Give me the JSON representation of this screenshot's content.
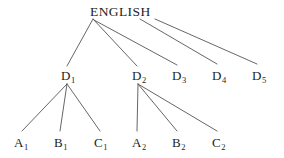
{
  "diagram": {
    "title": "ENGLISH",
    "type": "tree",
    "background_color": "#ffffff",
    "line_color": "#555555",
    "text_color": "#1d1d1d",
    "root": {
      "id": "root",
      "label": "ENGLISH",
      "base": "ENGLISH",
      "subscript": "",
      "x": 90,
      "y": 5,
      "anchor_x": 93,
      "anchor_y": 19
    },
    "level2": [
      {
        "id": "d1",
        "base": "D",
        "subscript": "1",
        "x": 61,
        "y": 69,
        "anchor_x": 67,
        "anchor_y": 67,
        "branch_apex_x": 67,
        "branch_apex_y": 84
      },
      {
        "id": "d2",
        "base": "D",
        "subscript": "2",
        "x": 132,
        "y": 69,
        "anchor_x": 138,
        "anchor_y": 67,
        "branch_apex_x": 138,
        "branch_apex_y": 84
      },
      {
        "id": "d3",
        "base": "D",
        "subscript": "3",
        "x": 172,
        "y": 69,
        "anchor_x": 178,
        "anchor_y": 67,
        "branch_apex_x": null,
        "branch_apex_y": null
      },
      {
        "id": "d4",
        "base": "D",
        "subscript": "4",
        "x": 212,
        "y": 69,
        "anchor_x": 218,
        "anchor_y": 67,
        "branch_apex_x": null,
        "branch_apex_y": null
      },
      {
        "id": "d5",
        "base": "D",
        "subscript": "5",
        "x": 252,
        "y": 69,
        "anchor_x": 258,
        "anchor_y": 67,
        "branch_apex_x": null,
        "branch_apex_y": null
      }
    ],
    "level3": [
      {
        "id": "a1",
        "base": "A",
        "subscript": "1",
        "x": 14,
        "y": 136,
        "anchor_x": 21,
        "anchor_y": 133,
        "parent": "d1"
      },
      {
        "id": "b1",
        "base": "B",
        "subscript": "1",
        "x": 54,
        "y": 136,
        "anchor_x": 60,
        "anchor_y": 133,
        "parent": "d1"
      },
      {
        "id": "c1",
        "base": "C",
        "subscript": "1",
        "x": 94,
        "y": 136,
        "anchor_x": 100,
        "anchor_y": 133,
        "parent": "d1"
      },
      {
        "id": "a2",
        "base": "A",
        "subscript": "2",
        "x": 132,
        "y": 136,
        "anchor_x": 138,
        "anchor_y": 133,
        "parent": "d2"
      },
      {
        "id": "b2",
        "base": "B",
        "subscript": "2",
        "x": 172,
        "y": 136,
        "anchor_x": 178,
        "anchor_y": 133,
        "parent": "d2"
      },
      {
        "id": "c2",
        "base": "C",
        "subscript": "2",
        "x": 212,
        "y": 136,
        "anchor_x": 218,
        "anchor_y": 133,
        "parent": "d2"
      }
    ],
    "edges": [
      {
        "id": "edge-root-d1",
        "from": "root",
        "to": "d1",
        "x1": 93,
        "y1": 19,
        "x2": 67,
        "y2": 66
      },
      {
        "id": "edge-root-d2",
        "from": "root",
        "to": "d2",
        "x1": 93,
        "y1": 19,
        "x2": 137,
        "y2": 66
      },
      {
        "id": "edge-root-d3",
        "from": "root",
        "to": "d3",
        "x1": 94,
        "y1": 20,
        "x2": 177,
        "y2": 65
      },
      {
        "id": "edge-root-d4",
        "from": "root",
        "to": "d4",
        "x1": 140,
        "y1": 19,
        "x2": 217,
        "y2": 64
      },
      {
        "id": "edge-root-d5",
        "from": "root",
        "to": "d5",
        "x1": 155,
        "y1": 19,
        "x2": 257,
        "y2": 64
      },
      {
        "id": "edge-d1-a1",
        "from": "d1",
        "to": "a1",
        "x1": 67,
        "y1": 84,
        "x2": 22,
        "y2": 131
      },
      {
        "id": "edge-d1-b1",
        "from": "d1",
        "to": "b1",
        "x1": 67,
        "y1": 84,
        "x2": 60,
        "y2": 131
      },
      {
        "id": "edge-d1-c1",
        "from": "d1",
        "to": "c1",
        "x1": 67,
        "y1": 84,
        "x2": 100,
        "y2": 131
      },
      {
        "id": "edge-d2-a2",
        "from": "d2",
        "to": "a2",
        "x1": 138,
        "y1": 84,
        "x2": 137,
        "y2": 131
      },
      {
        "id": "edge-d2-b2",
        "from": "d2",
        "to": "b2",
        "x1": 138,
        "y1": 84,
        "x2": 177,
        "y2": 131
      },
      {
        "id": "edge-d2-c2",
        "from": "d2",
        "to": "c2",
        "x1": 138,
        "y1": 84,
        "x2": 217,
        "y2": 131
      }
    ]
  }
}
